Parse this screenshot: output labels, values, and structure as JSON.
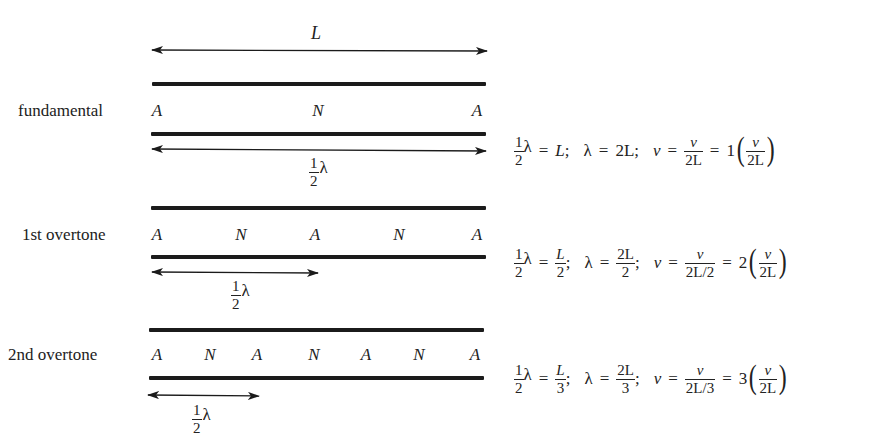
{
  "diagram": {
    "type": "standing waves in an open pipe (harmonics)",
    "length_label": "L",
    "half_lambda": {
      "num": "1",
      "den": "2",
      "sym": "λ"
    },
    "modes": [
      {
        "name": "fundamental",
        "nodes": [
          "A",
          "N",
          "A"
        ],
        "node_x": [
          157,
          318,
          476
        ],
        "equation": {
          "part1": {
            "lhs_num": "1",
            "lhs_den": "2",
            "lam": "λ",
            "eq": "=",
            "rhs": "L",
            "rhs_num": null,
            "rhs_den": null,
            "sep": ";"
          },
          "part2": {
            "lam": "λ",
            "eq": "=",
            "rhs": "2L",
            "rhs_num": null,
            "rhs_den": null,
            "sep": ";"
          },
          "part3": {
            "nu": "ν",
            "eq": "=",
            "f_num": "v",
            "f_den": "2L",
            "eq2": "=",
            "mult": "1",
            "p_num": "v",
            "p_den": "2L"
          }
        }
      },
      {
        "name": "1st overtone",
        "nodes": [
          "A",
          "N",
          "A",
          "N",
          "A"
        ],
        "node_x": [
          157,
          241,
          315,
          399,
          476
        ],
        "equation": {
          "part1": {
            "lhs_num": "1",
            "lhs_den": "2",
            "lam": "λ",
            "eq": "=",
            "rhs_num": "L",
            "rhs_den": "2",
            "sep": ";"
          },
          "part2": {
            "lam": "λ",
            "eq": "=",
            "rhs_num": "2L",
            "rhs_den": "2",
            "sep": ";"
          },
          "part3": {
            "nu": "ν",
            "eq": "=",
            "f_num": "v",
            "f_den": "2L/2",
            "eq2": "=",
            "mult": "2",
            "p_num": "v",
            "p_den": "2L"
          }
        }
      },
      {
        "name": "2nd overtone",
        "nodes": [
          "A",
          "N",
          "A",
          "N",
          "A",
          "N",
          "A"
        ],
        "node_x": [
          157,
          210,
          257,
          314,
          366,
          419,
          474
        ],
        "equation": {
          "part1": {
            "lhs_num": "1",
            "lhs_den": "2",
            "lam": "λ",
            "eq": "=",
            "rhs_num": "L",
            "rhs_den": "3",
            "sep": ";"
          },
          "part2": {
            "lam": "λ",
            "eq": "=",
            "rhs_num": "2L",
            "rhs_den": "3",
            "sep": ";"
          },
          "part3": {
            "nu": "ν",
            "eq": "=",
            "f_num": "v",
            "f_den": "2L/3",
            "eq2": "=",
            "mult": "3",
            "p_num": "v",
            "p_den": "2L"
          }
        }
      }
    ],
    "colors": {
      "ink": "#1b1b1b",
      "background": "#ffffff"
    }
  }
}
